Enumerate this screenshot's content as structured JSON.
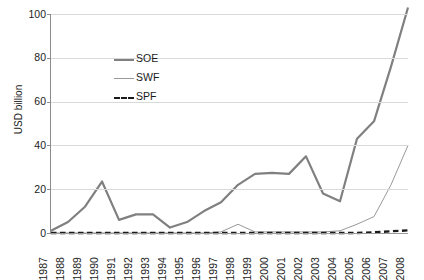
{
  "chart_data": {
    "type": "line",
    "title": "",
    "xlabel": "",
    "ylabel": "USD billion",
    "ylim": [
      0,
      100
    ],
    "yticks": [
      0,
      20,
      40,
      60,
      80,
      100
    ],
    "grid": true,
    "legend_position": "inside-upper-left",
    "x": [
      1987,
      1988,
      1989,
      1990,
      1991,
      1992,
      1993,
      1994,
      1995,
      1996,
      1997,
      1998,
      1999,
      2000,
      2001,
      2002,
      2003,
      2004,
      2005,
      2006,
      2007,
      2008
    ],
    "categories": [
      "1987",
      "1988",
      "1989",
      "1990",
      "1991",
      "1992",
      "1993",
      "1994",
      "1995",
      "1996",
      "1997",
      "1998",
      "1999",
      "2000",
      "2001",
      "2002",
      "2003",
      "2004",
      "2005",
      "2006",
      "2007",
      "2008"
    ],
    "series": [
      {
        "name": "SOE",
        "color": "#808080",
        "style": "solid-thick",
        "values": [
          1,
          5,
          12,
          23.5,
          6,
          8.5,
          8.5,
          2.5,
          5,
          10,
          14,
          22,
          27,
          27.5,
          27,
          35,
          18,
          14.5,
          43,
          51,
          76,
          103
        ]
      },
      {
        "name": "SWF",
        "color": "#999999",
        "style": "solid-thin",
        "values": [
          0,
          0,
          0,
          0,
          0,
          0,
          0,
          0,
          0,
          0,
          0.5,
          4,
          0.5,
          0.5,
          0.5,
          0.5,
          0.5,
          1,
          4,
          7.5,
          22,
          40
        ]
      },
      {
        "name": "SPF",
        "color": "#1a1a1a",
        "style": "dashed",
        "values": [
          0,
          0,
          0,
          0,
          0,
          0,
          0,
          0,
          0,
          0,
          0,
          0,
          0,
          0,
          0,
          0,
          0,
          0,
          0,
          0.3,
          0.8,
          1.2
        ]
      }
    ]
  },
  "legend": {
    "items": [
      {
        "label": "SOE",
        "icon": "line-swatch-thick-gray"
      },
      {
        "label": "SWF",
        "icon": "line-swatch-thin-gray"
      },
      {
        "label": "SPF",
        "icon": "line-swatch-dashed-black"
      }
    ]
  },
  "axes": {
    "y_label_text": "USD billion"
  }
}
